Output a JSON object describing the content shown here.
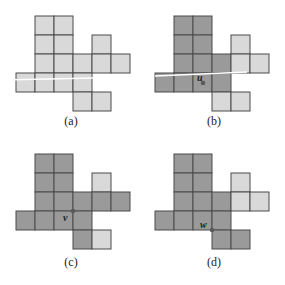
{
  "figure": {
    "cell_size": 19,
    "colors": {
      "light": "#d9d9d9",
      "dark": "#9a9a9a",
      "grid_line": "#4a4a4a",
      "vertex": "#5a5a5a",
      "highlight_line": "#ffffff"
    },
    "panels": [
      {
        "caption": "(a)",
        "origin": [
          16,
          16
        ],
        "cells": [
          {
            "r": 0,
            "c": 1,
            "shade": "light"
          },
          {
            "r": 0,
            "c": 2,
            "shade": "light"
          },
          {
            "r": 1,
            "c": 1,
            "shade": "light"
          },
          {
            "r": 1,
            "c": 2,
            "shade": "light"
          },
          {
            "r": 1,
            "c": 4,
            "shade": "light"
          },
          {
            "r": 2,
            "c": 1,
            "shade": "light"
          },
          {
            "r": 2,
            "c": 2,
            "shade": "light"
          },
          {
            "r": 2,
            "c": 3,
            "shade": "light"
          },
          {
            "r": 2,
            "c": 4,
            "shade": "light"
          },
          {
            "r": 2,
            "c": 5,
            "shade": "light"
          },
          {
            "r": 3,
            "c": 0,
            "shade": "light"
          },
          {
            "r": 3,
            "c": 1,
            "shade": "light"
          },
          {
            "r": 3,
            "c": 2,
            "shade": "light"
          },
          {
            "r": 3,
            "c": 3,
            "shade": "light"
          },
          {
            "r": 4,
            "c": 3,
            "shade": "light"
          },
          {
            "r": 4,
            "c": 4,
            "shade": "light"
          }
        ],
        "line": {
          "x1": 2,
          "y1": 80,
          "x2": 94,
          "y2": 78
        },
        "vertex": null
      },
      {
        "caption": "(b)",
        "origin": [
          12,
          16
        ],
        "cells": [
          {
            "r": 0,
            "c": 1,
            "shade": "dark"
          },
          {
            "r": 0,
            "c": 2,
            "shade": "dark"
          },
          {
            "r": 1,
            "c": 1,
            "shade": "dark"
          },
          {
            "r": 1,
            "c": 2,
            "shade": "dark"
          },
          {
            "r": 1,
            "c": 4,
            "shade": "light"
          },
          {
            "r": 2,
            "c": 1,
            "shade": "dark"
          },
          {
            "r": 2,
            "c": 2,
            "shade": "dark"
          },
          {
            "r": 2,
            "c": 3,
            "shade": "dark"
          },
          {
            "r": 2,
            "c": 4,
            "shade": "light"
          },
          {
            "r": 2,
            "c": 5,
            "shade": "light"
          },
          {
            "r": 3,
            "c": 0,
            "shade": "dark"
          },
          {
            "r": 3,
            "c": 1,
            "shade": "dark"
          },
          {
            "r": 3,
            "c": 2,
            "shade": "dark"
          },
          {
            "r": 3,
            "c": 3,
            "shade": "dark"
          },
          {
            "r": 4,
            "c": 3,
            "shade": "light"
          },
          {
            "r": 4,
            "c": 4,
            "shade": "light"
          }
        ],
        "line": {
          "x1": 12,
          "y1": 76,
          "x2": 104,
          "y2": 72
        },
        "vertex": {
          "label": "u",
          "x": 60,
          "y": 83,
          "label_dx": -6,
          "label_dy": -2
        }
      },
      {
        "caption": "(c)",
        "origin": [
          16,
          11
        ],
        "cells": [
          {
            "r": 0,
            "c": 1,
            "shade": "dark"
          },
          {
            "r": 0,
            "c": 2,
            "shade": "dark"
          },
          {
            "r": 1,
            "c": 1,
            "shade": "dark"
          },
          {
            "r": 1,
            "c": 2,
            "shade": "dark"
          },
          {
            "r": 1,
            "c": 4,
            "shade": "light"
          },
          {
            "r": 2,
            "c": 1,
            "shade": "dark"
          },
          {
            "r": 2,
            "c": 2,
            "shade": "dark"
          },
          {
            "r": 2,
            "c": 3,
            "shade": "dark"
          },
          {
            "r": 2,
            "c": 4,
            "shade": "dark"
          },
          {
            "r": 2,
            "c": 5,
            "shade": "dark"
          },
          {
            "r": 3,
            "c": 0,
            "shade": "dark"
          },
          {
            "r": 3,
            "c": 1,
            "shade": "dark"
          },
          {
            "r": 3,
            "c": 2,
            "shade": "dark"
          },
          {
            "r": 3,
            "c": 3,
            "shade": "dark"
          },
          {
            "r": 4,
            "c": 3,
            "shade": "dark"
          },
          {
            "r": 4,
            "c": 4,
            "shade": "light"
          }
        ],
        "line": null,
        "vertex": {
          "label": "v",
          "x": 73,
          "y": 68,
          "label_dx": -10,
          "label_dy": 10
        }
      },
      {
        "caption": "(d)",
        "origin": [
          12,
          11
        ],
        "cells": [
          {
            "r": 0,
            "c": 1,
            "shade": "dark"
          },
          {
            "r": 0,
            "c": 2,
            "shade": "dark"
          },
          {
            "r": 1,
            "c": 1,
            "shade": "dark"
          },
          {
            "r": 1,
            "c": 2,
            "shade": "dark"
          },
          {
            "r": 1,
            "c": 4,
            "shade": "light"
          },
          {
            "r": 2,
            "c": 1,
            "shade": "dark"
          },
          {
            "r": 2,
            "c": 2,
            "shade": "dark"
          },
          {
            "r": 2,
            "c": 3,
            "shade": "dark"
          },
          {
            "r": 2,
            "c": 4,
            "shade": "light"
          },
          {
            "r": 2,
            "c": 5,
            "shade": "light"
          },
          {
            "r": 3,
            "c": 0,
            "shade": "dark"
          },
          {
            "r": 3,
            "c": 1,
            "shade": "dark"
          },
          {
            "r": 3,
            "c": 2,
            "shade": "dark"
          },
          {
            "r": 3,
            "c": 3,
            "shade": "dark"
          },
          {
            "r": 4,
            "c": 3,
            "shade": "dark"
          },
          {
            "r": 4,
            "c": 4,
            "shade": "dark"
          }
        ],
        "line": null,
        "vertex": {
          "label": "w",
          "x": 69,
          "y": 87,
          "label_dx": -12,
          "label_dy": -2
        }
      }
    ]
  }
}
